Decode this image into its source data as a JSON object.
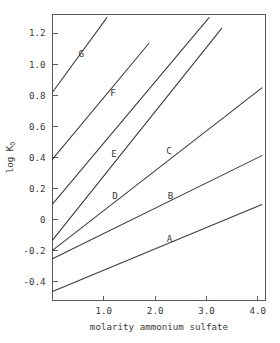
{
  "chart_data": {
    "type": "line",
    "title": "",
    "subtitle": "",
    "xlabel": "molarity ammonium sulfate",
    "ylabel": "log K",
    "ylabel_subscript": "D",
    "xlim": [
      0.0,
      4.15
    ],
    "ylim": [
      -0.52,
      1.32
    ],
    "grid": false,
    "legend": "inline-labels",
    "x_ticks": [
      {
        "value": 1.0,
        "label": "1.0"
      },
      {
        "value": 2.0,
        "label": "2.0"
      },
      {
        "value": 3.0,
        "label": "3.0"
      },
      {
        "value": 4.0,
        "label": "4.0"
      }
    ],
    "y_ticks": [
      {
        "value": 1.2,
        "label": "1.2"
      },
      {
        "value": 1.0,
        "label": "1.0"
      },
      {
        "value": 0.8,
        "label": "0.8"
      },
      {
        "value": 0.6,
        "label": "0.6"
      },
      {
        "value": 0.4,
        "label": "0.4"
      },
      {
        "value": 0.2,
        "label": "0.2"
      },
      {
        "value": 0.0,
        "label": "0"
      },
      {
        "value": -0.2,
        "label": "-0.2"
      },
      {
        "value": -0.4,
        "label": "-0.4"
      }
    ],
    "series": [
      {
        "name": "A",
        "label": "A",
        "label_x": 2.28,
        "label_y": -0.145,
        "x": [
          0.0,
          4.08
        ],
        "y": [
          -0.462,
          0.097
        ],
        "slope": 0.137,
        "intercept": -0.462
      },
      {
        "name": "B",
        "label": "B",
        "label_x": 2.3,
        "label_y": 0.135,
        "x": [
          0.0,
          4.08
        ],
        "y": [
          -0.252,
          0.412
        ],
        "slope": 0.163,
        "intercept": -0.252
      },
      {
        "name": "C",
        "label": "C",
        "label_x": 2.27,
        "label_y": 0.425,
        "x": [
          0.0,
          4.08
        ],
        "y": [
          -0.198,
          0.848
        ],
        "slope": 0.256,
        "intercept": -0.198
      },
      {
        "name": "D",
        "label": "D",
        "label_x": 1.22,
        "label_y": 0.135,
        "x": [
          0.0,
          3.3
        ],
        "y": [
          -0.132,
          1.232
        ],
        "slope": 0.413,
        "intercept": -0.132
      },
      {
        "name": "E",
        "label": "E",
        "label_x": 1.2,
        "label_y": 0.405,
        "x": [
          0.0,
          3.05
        ],
        "y": [
          0.1,
          1.3
        ],
        "slope": 0.393,
        "intercept": 0.1
      },
      {
        "name": "F",
        "label": "F",
        "label_x": 1.18,
        "label_y": 0.795,
        "x": [
          0.0,
          1.88
        ],
        "y": [
          0.39,
          1.135
        ],
        "slope": 0.396,
        "intercept": 0.39
      },
      {
        "name": "G",
        "label": "G",
        "label_x": 0.56,
        "label_y": 1.045,
        "x": [
          0.0,
          1.06
        ],
        "y": [
          0.82,
          1.3
        ],
        "slope": 0.453,
        "intercept": 0.82
      }
    ]
  }
}
